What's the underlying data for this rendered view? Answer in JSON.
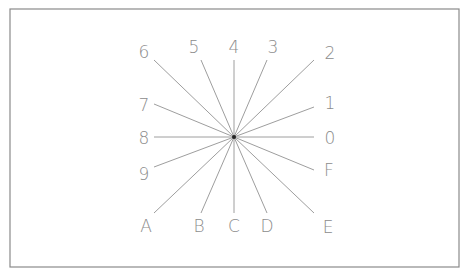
{
  "diagram": {
    "type": "direction-star",
    "center": {
      "x": 234,
      "y": 137
    },
    "frame": {
      "x": 10,
      "y": 9,
      "width": 449,
      "height": 258,
      "stroke": "#8a8a8a"
    },
    "colors": {
      "ray": "#9e9e9e",
      "label": "#8c8c8c",
      "center_dot": "#222222",
      "frame": "#8a8a8a"
    },
    "rays": [
      {
        "label": "0",
        "end": [
          314,
          137
        ],
        "label_pos": [
          330,
          144
        ]
      },
      {
        "label": "1",
        "end": [
          314,
          107
        ],
        "label_pos": [
          330,
          109
        ]
      },
      {
        "label": "2",
        "end": [
          314,
          60
        ],
        "label_pos": [
          330,
          59
        ]
      },
      {
        "label": "3",
        "end": [
          267,
          60
        ],
        "label_pos": [
          273,
          53
        ]
      },
      {
        "label": "4",
        "end": [
          234,
          60
        ],
        "label_pos": [
          234,
          53
        ]
      },
      {
        "label": "5",
        "end": [
          201,
          60
        ],
        "label_pos": [
          194,
          53
        ]
      },
      {
        "label": "6",
        "end": [
          154,
          60
        ],
        "label_pos": [
          144,
          58
        ]
      },
      {
        "label": "7",
        "end": [
          154,
          104
        ],
        "label_pos": [
          144,
          111
        ]
      },
      {
        "label": "8",
        "end": [
          154,
          137
        ],
        "label_pos": [
          144,
          144
        ]
      },
      {
        "label": "9",
        "end": [
          154,
          167
        ],
        "label_pos": [
          144,
          180
        ]
      },
      {
        "label": "A",
        "end": [
          154,
          213
        ],
        "label_pos": [
          146,
          232
        ]
      },
      {
        "label": "B",
        "end": [
          201,
          213
        ],
        "label_pos": [
          199,
          232
        ]
      },
      {
        "label": "C",
        "end": [
          234,
          213
        ],
        "label_pos": [
          234,
          232
        ]
      },
      {
        "label": "D",
        "end": [
          267,
          213
        ],
        "label_pos": [
          267,
          232
        ]
      },
      {
        "label": "E",
        "end": [
          314,
          213
        ],
        "label_pos": [
          328,
          233
        ]
      },
      {
        "label": "F",
        "end": [
          314,
          170
        ],
        "label_pos": [
          329,
          176
        ]
      }
    ]
  }
}
